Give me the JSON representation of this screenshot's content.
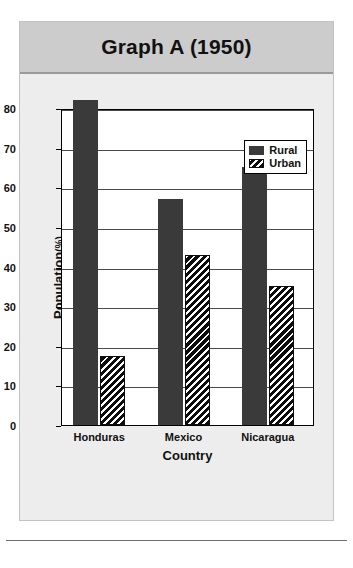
{
  "chart_data": {
    "type": "bar",
    "title": "Graph A (1950)",
    "xlabel": "Country",
    "ylabel": "Population",
    "ylabel_unit": "(%)",
    "categories": [
      "Honduras",
      "Mexico",
      "Nicaragua"
    ],
    "series": [
      {
        "name": "Rural",
        "values": [
          82,
          57,
          65
        ],
        "color": "#3a3a3a",
        "pattern": "solid"
      },
      {
        "name": "Urban",
        "values": [
          17.5,
          43,
          35
        ],
        "color": "#0d0d0d",
        "pattern": "diagonal-hatch"
      }
    ],
    "ylim": [
      0,
      80
    ],
    "yticks": [
      0,
      10,
      20,
      30,
      40,
      50,
      60,
      70,
      80
    ],
    "ytick_labels": [
      "0",
      "10",
      "20",
      "30",
      "40",
      "50",
      "60",
      "70",
      "80"
    ],
    "grid": true,
    "grid_axis": "y",
    "legend_position": "top-right"
  },
  "figure": {
    "title_band_color": "#cccccc",
    "body_color": "#ededed",
    "plot_background": "#ffffff"
  }
}
